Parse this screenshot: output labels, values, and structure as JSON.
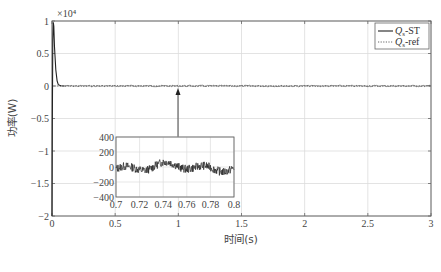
{
  "chart_data": {
    "type": "line",
    "title": "",
    "xlabel": "时间(s)",
    "ylabel": "功率(W)",
    "y_multiplier": "×10⁴",
    "xlim": [
      0,
      3
    ],
    "ylim": [
      -2,
      1
    ],
    "grid": true,
    "legend_position": "upper-right",
    "x_ticks": [
      "0",
      "0.5",
      "1",
      "1.5",
      "2",
      "2.5",
      "3"
    ],
    "y_ticks": [
      "1",
      "0.5",
      "0",
      "-0.5",
      "-1",
      "-1.5",
      "-2"
    ],
    "series": [
      {
        "name": "Qs-ST",
        "label_main": "Q",
        "label_sub": "s",
        "label_suffix": "-ST",
        "style": "solid",
        "color": "#222222",
        "x": [
          0,
          0.002,
          0.006,
          0.01,
          0.014,
          0.02,
          0.03,
          0.04,
          0.05,
          0.07,
          0.1,
          0.5,
          1.0,
          1.5,
          2.0,
          2.5,
          3.0
        ],
        "values": [
          -2,
          -0.6,
          0.7,
          0.98,
          0.92,
          0.6,
          0.25,
          0.08,
          0.02,
          0.004,
          0,
          0,
          0,
          0,
          0,
          0,
          0
        ]
      },
      {
        "name": "Qs-ref",
        "label_main": "Q",
        "label_sub": "s",
        "label_suffix": "-ref",
        "style": "dotted",
        "color": "#555555",
        "x": [
          0,
          3
        ],
        "values": [
          0,
          0
        ]
      }
    ],
    "annotation": {
      "type": "arrow",
      "from_x": 1.0,
      "points_to": [
        1.0,
        0
      ],
      "description": "zoom inset of 0.7–0.8 s"
    },
    "inset": {
      "type": "line",
      "xlim": [
        0.7,
        0.8
      ],
      "ylim": [
        -400,
        400
      ],
      "x_ticks": [
        "0.7",
        "0.72",
        "0.74",
        "0.76",
        "0.78",
        "0.8"
      ],
      "y_ticks": [
        "400",
        "200",
        "0",
        "-200",
        "-400"
      ],
      "grid": true,
      "series_description": "Qs-ST noisy ripple around 0, amplitude roughly ±100 W",
      "approx_range": [
        -130,
        120
      ]
    }
  }
}
